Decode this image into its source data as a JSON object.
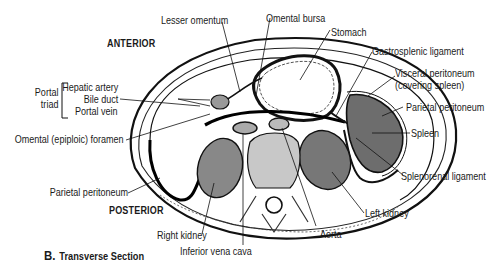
{
  "figure": {
    "caption_letter": "B.",
    "caption_text": "Transverse Section",
    "orientation": {
      "anterior": "ANTERIOR",
      "posterior": "POSTERIOR"
    },
    "portal_triad": {
      "group_label_line1": "Portal",
      "group_label_line2": "triad",
      "items": [
        "Hepatic artery",
        "Bile duct",
        "Portal vein"
      ]
    },
    "labels": {
      "lesser_omentum": "Lesser omentum",
      "omental_bursa": "Omental bursa",
      "stomach": "Stomach",
      "gastrosplenic_ligament": "Gastrosplenic ligament",
      "visceral_peritoneum_1": "Visceral peritoneum",
      "visceral_peritoneum_2": "(covering spleen)",
      "parietal_peritoneum_right": "Parietal peritoneum",
      "spleen": "Spleen",
      "splenorenal_ligament": "Splenorenal ligament",
      "omental_foramen": "Omental (epiploic) foramen",
      "parietal_peritoneum_left": "Parietal peritoneum",
      "left_kidney": "Left kidney",
      "right_kidney": "Right kidney",
      "aorta": "Aorta",
      "inferior_vena_cava": "Inferior vena cava"
    }
  }
}
